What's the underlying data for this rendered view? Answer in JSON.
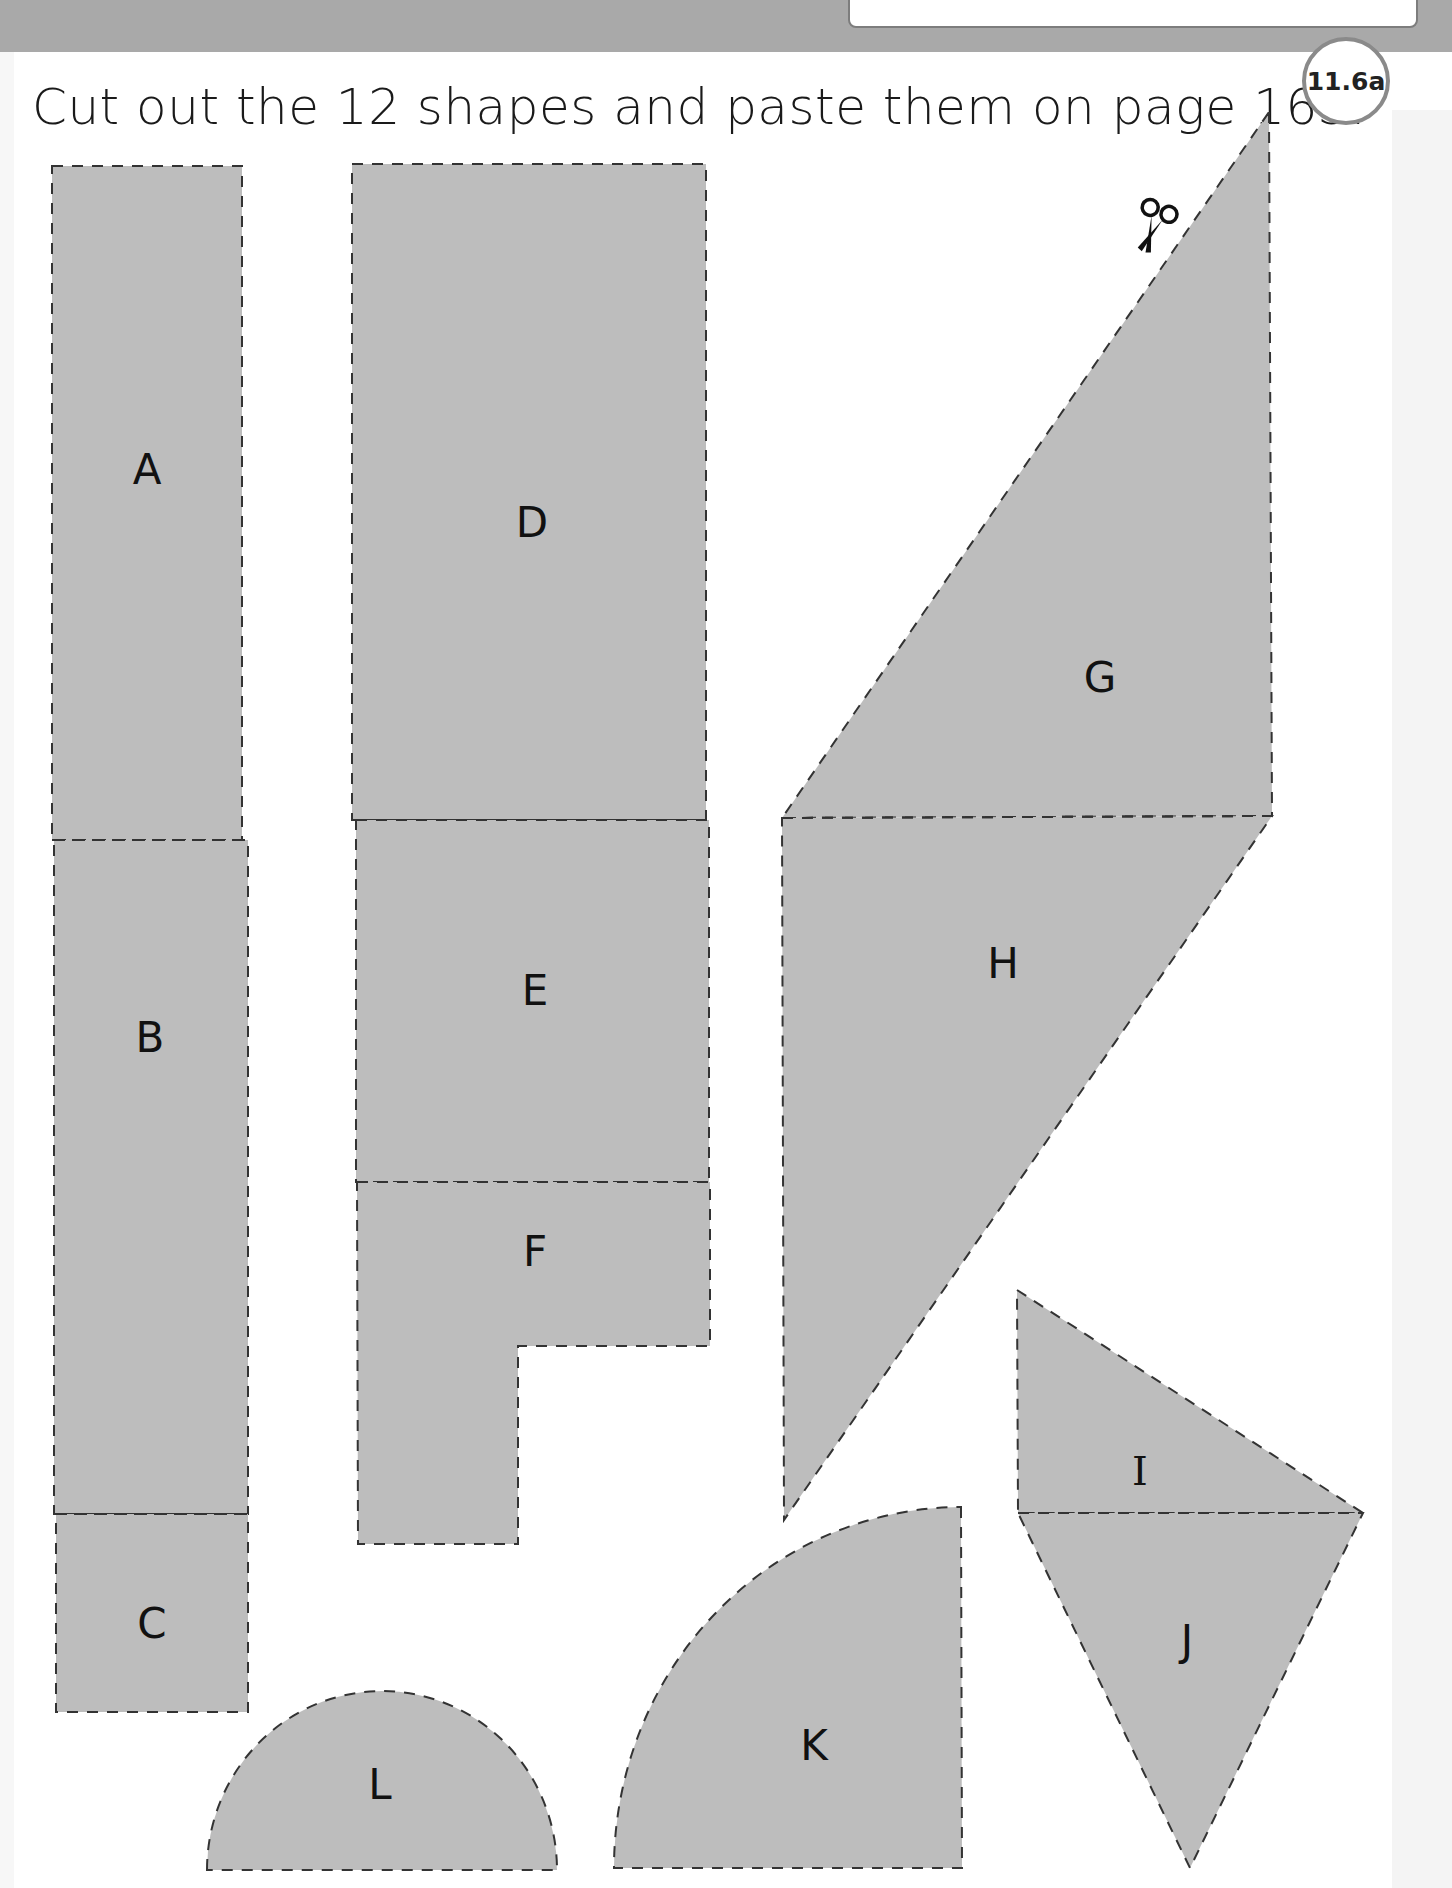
{
  "header": {
    "name_box_value": "",
    "lesson_badge": "11.6a"
  },
  "instruction": "Cut out the 12 shapes and paste them on page 163.",
  "colors": {
    "shape_fill": "#bdbdbd",
    "cut_line": "#333333",
    "header_band": "#a9a9a9",
    "badge_border": "#8a8a8a"
  },
  "icons": {
    "scissors": "scissors-icon"
  },
  "shapes": [
    {
      "label": "A",
      "type": "rectangle"
    },
    {
      "label": "B",
      "type": "rectangle"
    },
    {
      "label": "C",
      "type": "rectangle"
    },
    {
      "label": "D",
      "type": "rectangle"
    },
    {
      "label": "E",
      "type": "rectangle"
    },
    {
      "label": "F",
      "type": "L-shape"
    },
    {
      "label": "G",
      "type": "right-triangle"
    },
    {
      "label": "H",
      "type": "trapezoid"
    },
    {
      "label": "I",
      "type": "right-triangle"
    },
    {
      "label": "J",
      "type": "triangle"
    },
    {
      "label": "K",
      "type": "quarter-circle"
    },
    {
      "label": "L",
      "type": "semicircle"
    }
  ]
}
